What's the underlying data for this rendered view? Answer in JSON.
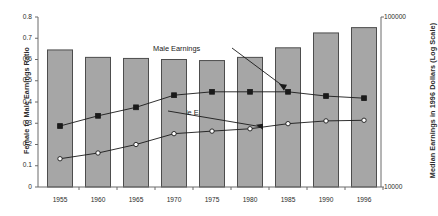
{
  "chart_data": {
    "type": "bar",
    "title": "",
    "categories": [
      "1955",
      "1960",
      "1965",
      "1970",
      "1975",
      "1980",
      "1985",
      "1990",
      "1996"
    ],
    "xlabel": "",
    "ylabel": "Female to Male Earnings Ratio",
    "y2label": "Median Earnings in 1996 Dollars (Log Scale)",
    "ylim": [
      0,
      0.8
    ],
    "y2lim": [
      10000,
      100000
    ],
    "y2_scale": "log",
    "grid": false,
    "legend_position": "annotations",
    "y_ticks": [
      "0",
      "0.1",
      "0.2",
      "0.3",
      "0.4",
      "0.5",
      "0.6",
      "0.7",
      "0.8"
    ],
    "y_tick_values": [
      0,
      0.1,
      0.2,
      0.3,
      0.4,
      0.5,
      0.6,
      0.7,
      0.8
    ],
    "y2_ticks": [
      "10000",
      "100000"
    ],
    "y2_tick_values": [
      10000,
      100000
    ],
    "bars": {
      "name": "Female to Male Earnings Ratio",
      "values": [
        0.645,
        0.61,
        0.605,
        0.6,
        0.595,
        0.61,
        0.655,
        0.725,
        0.75
      ],
      "color": "#a6a6a6",
      "edge_color": "#4d4d4d"
    },
    "series": [
      {
        "name": "Male Earnings",
        "axis": "right",
        "marker": "filled-square",
        "color": "#1a1a1a",
        "plot_values": [
          0.287,
          0.335,
          0.375,
          0.432,
          0.448,
          0.448,
          0.448,
          0.428,
          0.418
        ],
        "values": [
          23300,
          26400,
          29300,
          34400,
          36000,
          36000,
          36000,
          34100,
          33200
        ]
      },
      {
        "name": "Female Earnings",
        "axis": "right",
        "marker": "open-diamond",
        "color": "#1a1a1a",
        "plot_values": [
          0.133,
          0.16,
          0.2,
          0.251,
          0.263,
          0.274,
          0.298,
          0.311,
          0.314
        ],
        "values": [
          13400,
          14900,
          17000,
          20200,
          21000,
          21800,
          23600,
          24700,
          24900
        ]
      }
    ],
    "annotations": [
      {
        "text": "Male Earnings",
        "target_series": "Male Earnings"
      },
      {
        "text": "Female Earnings",
        "target_series": "Female Earnings"
      }
    ]
  }
}
